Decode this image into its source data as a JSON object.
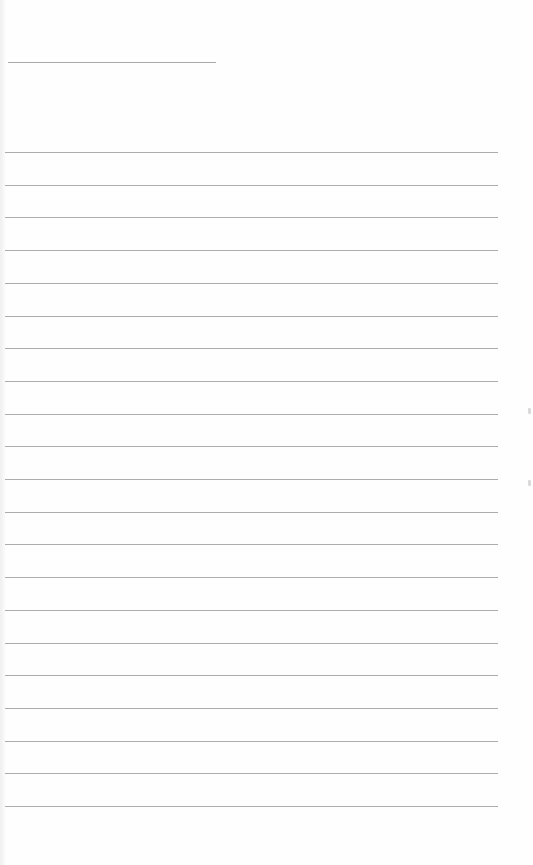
{
  "document": {
    "type": "lined-notepad-page",
    "title_line": {
      "present": true,
      "text": ""
    },
    "ruled_lines": {
      "count": 21,
      "first_y": 152,
      "spacing": 32.7,
      "left": 5,
      "right": 498,
      "color": "#acacac"
    },
    "lines_text": [
      "",
      "",
      "",
      "",
      "",
      "",
      "",
      "",
      "",
      "",
      "",
      "",
      "",
      "",
      "",
      "",
      "",
      "",
      "",
      "",
      ""
    ],
    "background_color": "#fefefe"
  }
}
